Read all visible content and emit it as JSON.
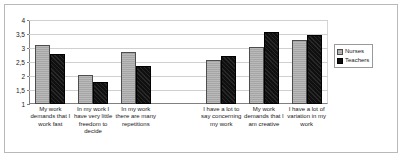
{
  "chart_data": {
    "type": "bar",
    "title": "",
    "subtitle": "",
    "xlabel": "",
    "ylabel": "",
    "ylim": [
      1,
      4
    ],
    "ytick_labels": [
      "4",
      "3,5",
      "3",
      "2,5",
      "2",
      "1,5",
      "1"
    ],
    "ytick_values": [
      4,
      3.5,
      3,
      2.5,
      2,
      1.5,
      1
    ],
    "grid": true,
    "legend_position": "right",
    "decimal_separator": ",",
    "categories": [
      "My work demands that I work fast",
      "In my work I have very little freedom to decide",
      "In my work there are many repetitions",
      "",
      "I have a lot to say concerning my work",
      "My work demands that I am creative",
      "I have a lot of variation in my work"
    ],
    "series": [
      {
        "name": "Nurses",
        "color": "#a6a6a6",
        "values": [
          3.12,
          2.02,
          2.85,
          null,
          2.58,
          3.05,
          3.27
        ]
      },
      {
        "name": "Teachers",
        "color": "#101010",
        "values": [
          2.77,
          1.78,
          2.35,
          null,
          2.72,
          3.58,
          3.48
        ]
      }
    ]
  },
  "legend": {
    "items": [
      {
        "label": "Nurses",
        "marker": "legend-swatch-nurses"
      },
      {
        "label": "Teachers",
        "marker": "legend-swatch-teachers"
      }
    ]
  }
}
